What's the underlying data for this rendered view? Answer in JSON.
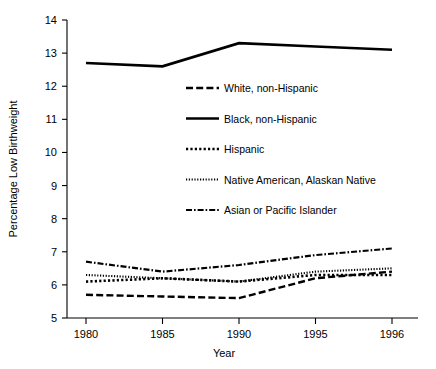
{
  "chart_data": {
    "type": "line",
    "title": "",
    "xlabel": "Year",
    "ylabel": "Percentage Low Birthweight",
    "categories": [
      "1980",
      "1985",
      "1990",
      "1995",
      "1996"
    ],
    "x": [
      1980,
      1985,
      1990,
      1995,
      1996
    ],
    "ylim": [
      5,
      14
    ],
    "yticks": [
      "5",
      "6",
      "7",
      "8",
      "9",
      "10",
      "11",
      "12",
      "13",
      "14"
    ],
    "grid": false,
    "legend_position": "center",
    "series": [
      {
        "name": "White, non-Hispanic",
        "style": "dashed",
        "color": "#000000",
        "values": [
          5.7,
          5.65,
          5.6,
          6.2,
          6.4
        ]
      },
      {
        "name": "Black, non-Hispanic",
        "style": "solid",
        "color": "#000000",
        "values": [
          12.7,
          12.6,
          13.3,
          13.2,
          13.1
        ]
      },
      {
        "name": "Hispanic",
        "style": "dotted",
        "color": "#000000",
        "values": [
          6.1,
          6.2,
          6.1,
          6.3,
          6.3
        ]
      },
      {
        "name": "Native American, Alaskan Native",
        "style": "fine-dotted",
        "color": "#000000",
        "values": [
          6.3,
          6.2,
          6.1,
          6.4,
          6.5
        ]
      },
      {
        "name": "Asian or Pacific Islander",
        "style": "dash-dot",
        "color": "#000000",
        "values": [
          6.7,
          6.4,
          6.6,
          6.9,
          7.1
        ]
      }
    ]
  },
  "axes": {
    "y_label": "Percentage Low Birthweight",
    "x_label": "Year",
    "y_ticks": [
      "14",
      "13",
      "12",
      "11",
      "10",
      "9",
      "8",
      "7",
      "6",
      "5"
    ],
    "x_ticks": [
      "1980",
      "1985",
      "1990",
      "1995",
      "1996"
    ]
  },
  "legend": {
    "items": [
      {
        "label": "White, non-Hispanic"
      },
      {
        "label": "Black, non-Hispanic"
      },
      {
        "label": "Hispanic"
      },
      {
        "label": "Native American, Alaskan Native"
      },
      {
        "label": "Asian or Pacific Islander"
      }
    ]
  }
}
